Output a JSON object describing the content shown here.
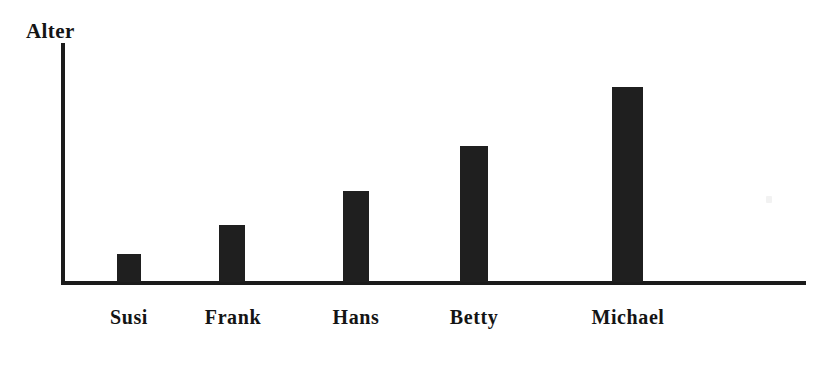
{
  "chart_data": {
    "type": "bar",
    "title": "",
    "subtitle": "",
    "xlabel": "",
    "ylabel": "Alter",
    "categories": [
      "Susi",
      "Frank",
      "Hans",
      "Betty",
      "Michael"
    ],
    "values": [
      8,
      16,
      26,
      39,
      56
    ],
    "series": [
      {
        "name": "Alter",
        "values": [
          8,
          16,
          26,
          39,
          56
        ]
      }
    ],
    "bar_pixel_heights": [
      28,
      57,
      91,
      136,
      195
    ],
    "ylim": [
      0,
      62
    ],
    "grid": false,
    "legend": false,
    "legend_position": "none",
    "tick_labels_y": [],
    "annotations": [],
    "colors": {
      "bar": "#1f1f1f",
      "axis": "#1b1b1b",
      "text": "#141414",
      "background": "#ffffff"
    }
  },
  "axes": {
    "y_title": "Alter"
  },
  "bars": [
    {
      "label": "Susi",
      "value": 8,
      "left": 117,
      "width": 24,
      "top": 254,
      "height": 28,
      "label_left": 92,
      "label_width": 74
    },
    {
      "label": "Frank",
      "value": 16,
      "left": 219,
      "width": 26,
      "top": 225,
      "height": 57,
      "label_left": 193,
      "label_width": 80
    },
    {
      "label": "Hans",
      "value": 26,
      "left": 343,
      "width": 26,
      "top": 191,
      "height": 91,
      "label_left": 316,
      "label_width": 80
    },
    {
      "label": "Betty",
      "value": 39,
      "left": 460,
      "width": 28,
      "top": 146,
      "height": 136,
      "label_left": 431,
      "label_width": 86
    },
    {
      "label": "Michael",
      "value": 56,
      "left": 612,
      "width": 31,
      "top": 87,
      "height": 195,
      "label_left": 562,
      "label_width": 132
    }
  ]
}
